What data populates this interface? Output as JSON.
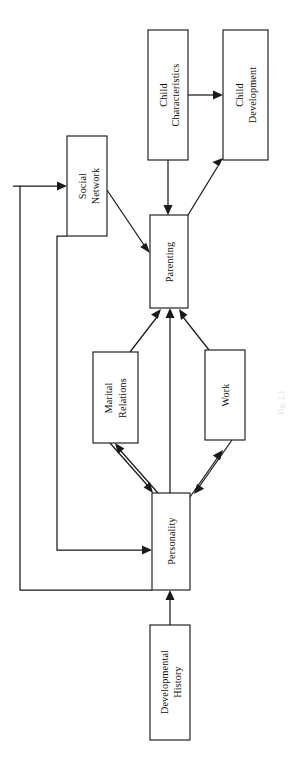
{
  "figure": {
    "orientation": "rotated-90-ccw",
    "background_color": "#ffffff",
    "line_color": "#1a1a1a",
    "text_color": "#0d0d0d",
    "caption_fragment": "Fig. 2.1"
  },
  "nodes": [
    {
      "id": "child_characteristics",
      "label_line1": "Child",
      "label_line2": "Characteristics",
      "x": 148,
      "y": 30,
      "w": 40,
      "h": 130
    },
    {
      "id": "child_development",
      "label_line1": "Child",
      "label_line2": "Development",
      "x": 223,
      "y": 30,
      "w": 45,
      "h": 130
    },
    {
      "id": "social_network",
      "label_line1": "Social",
      "label_line2": "Network",
      "x": 67,
      "y": 136,
      "w": 40,
      "h": 100
    },
    {
      "id": "parenting",
      "label_line1": "Parenting",
      "label_line2": "",
      "x": 150,
      "y": 215,
      "w": 38,
      "h": 93
    },
    {
      "id": "marital_relations",
      "label_line1": "Marital",
      "label_line2": "Relations",
      "x": 93,
      "y": 352,
      "w": 45,
      "h": 91
    },
    {
      "id": "work",
      "label_line1": "Work",
      "label_line2": "",
      "x": 205,
      "y": 350,
      "w": 40,
      "h": 90
    },
    {
      "id": "personality",
      "label_line1": "Personality",
      "label_line2": "",
      "x": 152,
      "y": 493,
      "w": 38,
      "h": 97
    },
    {
      "id": "developmental_history",
      "label_line1": "Developmental",
      "label_line2": "History",
      "x": 150,
      "y": 625,
      "w": 40,
      "h": 115
    }
  ],
  "edges": [
    {
      "id": "child_characteristics_to_child_development",
      "from": "child_characteristics",
      "to": "child_development",
      "style": "straight"
    },
    {
      "id": "child_characteristics_to_parenting",
      "from": "child_characteristics",
      "to": "parenting",
      "style": "straight"
    },
    {
      "id": "parenting_to_child_development",
      "from": "parenting",
      "to": "child_development",
      "style": "diagonal"
    },
    {
      "id": "social_network_to_parenting",
      "from": "social_network",
      "to": "parenting",
      "style": "diagonal"
    },
    {
      "id": "marital_relations_to_parenting",
      "from": "marital_relations",
      "to": "parenting",
      "style": "diagonal"
    },
    {
      "id": "personality_to_parenting",
      "from": "personality",
      "to": "parenting",
      "style": "straight"
    },
    {
      "id": "work_to_parenting",
      "from": "work",
      "to": "parenting",
      "style": "diagonal"
    },
    {
      "id": "personality_to_marital_relations",
      "from": "personality",
      "to": "marital_relations",
      "style": "diagonal"
    },
    {
      "id": "marital_relations_to_personality",
      "from": "marital_relations",
      "to": "personality",
      "style": "diagonal"
    },
    {
      "id": "personality_to_work",
      "from": "personality",
      "to": "work",
      "style": "diagonal"
    },
    {
      "id": "work_to_personality",
      "from": "work",
      "to": "personality",
      "style": "diagonal"
    },
    {
      "id": "developmental_history_to_personality",
      "from": "developmental_history",
      "to": "personality",
      "style": "straight"
    },
    {
      "id": "personality_to_social_network",
      "from": "personality",
      "to": "social_network",
      "style": "orthogonal"
    },
    {
      "id": "social_network_to_personality",
      "from": "social_network",
      "to": "personality",
      "style": "orthogonal"
    }
  ]
}
